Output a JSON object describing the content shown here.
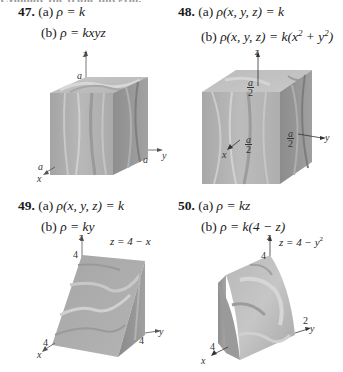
{
  "header_cut": "Evaluate the triple integral.",
  "problems": [
    {
      "number": "47.",
      "a_label": "(a)",
      "a_expr": "ρ = k",
      "b_label": "(b)",
      "b_expr": "ρ = kxyz",
      "figure": {
        "shape": "cube",
        "axes": {
          "z": "z",
          "x": "x",
          "y": "y"
        },
        "ticks": {
          "z": "a",
          "x": "a",
          "y": "a"
        }
      }
    },
    {
      "number": "48.",
      "a_label": "(a)",
      "a_expr": "ρ(x, y, z) = k",
      "b_label": "(b)",
      "b_expr_pre": "ρ(x, y, z) = k(x",
      "b_sup1": "2",
      "b_mid": " + y",
      "b_sup2": "2",
      "b_post": ")",
      "figure": {
        "shape": "cube-centered",
        "axes": {
          "z": "z",
          "x": "x",
          "y": "y"
        },
        "ticks": {
          "z": {
            "num": "a",
            "den": "2"
          },
          "x": {
            "num": "a",
            "den": "2"
          },
          "y": {
            "num": "a",
            "den": "2"
          }
        }
      }
    },
    {
      "number": "49.",
      "a_label": "(a)",
      "a_expr": "ρ(x, y, z) = k",
      "b_label": "(b)",
      "b_expr": "ρ = ky",
      "figure": {
        "shape": "wedge",
        "surface": "z = 4 − x",
        "axes": {
          "z": "z",
          "x": "x",
          "y": "y"
        },
        "ticks": {
          "z": "4",
          "x": "4",
          "y": "4"
        }
      }
    },
    {
      "number": "50.",
      "a_label": "(a)",
      "a_expr": "ρ = kz",
      "b_label": "(b)",
      "b_expr": "ρ = k(4 − z)",
      "figure": {
        "shape": "parabolic-cylinder",
        "surface_pre": "z = 4 − y",
        "surface_sup": "2",
        "axes": {
          "z": "z",
          "x": "x",
          "y": "y"
        },
        "ticks": {
          "z": "4",
          "x": "4",
          "y": "2"
        }
      }
    }
  ]
}
